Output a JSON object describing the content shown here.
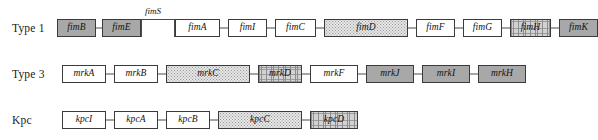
{
  "figure": {
    "type": "gene-cluster-diagram",
    "background": "#ffffff",
    "width": 528,
    "height": 140,
    "fill_legend": {
      "white": "#ffffff",
      "solid_gray": "#a8a8a8",
      "stipple_light": "#e6e6e6",
      "hatch": "#d2d2d2",
      "hatch_dark": "#9e9e9e"
    }
  },
  "rows": [
    {
      "id": "type-1",
      "label": "Type 1",
      "top": 8,
      "genes": [
        {
          "name": "fimB",
          "x": 57,
          "w": 39,
          "h": 18,
          "fill": "fill-gray"
        },
        {
          "name": "fimE",
          "x": 102,
          "w": 39,
          "h": 18,
          "fill": "fill-gray"
        },
        {
          "name": "fimA",
          "x": 175,
          "w": 45,
          "h": 18,
          "fill": "fill-white"
        },
        {
          "name": "fimI",
          "x": 228,
          "w": 39,
          "h": 18,
          "fill": "fill-white"
        },
        {
          "name": "fimC",
          "x": 275,
          "w": 41,
          "h": 18,
          "fill": "fill-white"
        },
        {
          "name": "fimD",
          "x": 324,
          "w": 84,
          "h": 18,
          "fill": "fill-stipple"
        },
        {
          "name": "fimF",
          "x": 416,
          "w": 39,
          "h": 18,
          "fill": "fill-white"
        },
        {
          "name": "fimG",
          "x": 463,
          "w": 39,
          "h": 18,
          "fill": "fill-white"
        },
        {
          "name": "fimH",
          "x": 510,
          "w": 41,
          "h": 18,
          "fill": "fill-hatch"
        },
        {
          "name": "fimK",
          "x": 559,
          "w": 39,
          "h": 18,
          "fill": "fill-gray"
        }
      ],
      "connectors": [
        {
          "x": 96,
          "w": 6
        },
        {
          "x": 220,
          "w": 8
        },
        {
          "x": 267,
          "w": 8
        },
        {
          "x": 316,
          "w": 8
        },
        {
          "x": 408,
          "w": 8
        },
        {
          "x": 455,
          "w": 8
        },
        {
          "x": 502,
          "w": 8
        },
        {
          "x": 551,
          "w": 8
        }
      ],
      "switch": {
        "label": "fimS",
        "x": 141,
        "w": 34,
        "label_x": 145,
        "label_y": -2
      }
    },
    {
      "id": "type-3",
      "label": "Type 3",
      "top": 54,
      "genes": [
        {
          "name": "mrkA",
          "x": 62,
          "w": 44,
          "h": 18,
          "fill": "fill-white"
        },
        {
          "name": "mrkB",
          "x": 114,
          "w": 44,
          "h": 18,
          "fill": "fill-white"
        },
        {
          "name": "mrkC",
          "x": 166,
          "w": 84,
          "h": 18,
          "fill": "fill-stipple"
        },
        {
          "name": "mrkD",
          "x": 258,
          "w": 44,
          "h": 18,
          "fill": "fill-hatch"
        },
        {
          "name": "mrkF",
          "x": 310,
          "w": 48,
          "h": 18,
          "fill": "fill-white"
        },
        {
          "name": "mrkJ",
          "x": 366,
          "w": 48,
          "h": 18,
          "fill": "fill-gray"
        },
        {
          "name": "mrkI",
          "x": 422,
          "w": 48,
          "h": 18,
          "fill": "fill-gray"
        },
        {
          "name": "mrkH",
          "x": 478,
          "w": 48,
          "h": 18,
          "fill": "fill-gray"
        }
      ],
      "connectors": [
        {
          "x": 106,
          "w": 8
        },
        {
          "x": 158,
          "w": 8
        },
        {
          "x": 250,
          "w": 8
        },
        {
          "x": 302,
          "w": 8
        },
        {
          "x": 358,
          "w": 8
        },
        {
          "x": 414,
          "w": 8
        },
        {
          "x": 470,
          "w": 8
        }
      ]
    },
    {
      "id": "kpc",
      "label": "Kpc",
      "top": 100,
      "genes": [
        {
          "name": "kpcI",
          "x": 62,
          "w": 44,
          "h": 18,
          "fill": "fill-white"
        },
        {
          "name": "kpcA",
          "x": 114,
          "w": 44,
          "h": 18,
          "fill": "fill-white"
        },
        {
          "name": "kpcB",
          "x": 166,
          "w": 44,
          "h": 18,
          "fill": "fill-white"
        },
        {
          "name": "kpcC",
          "x": 218,
          "w": 84,
          "h": 18,
          "fill": "fill-stipple"
        },
        {
          "name": "kpcD",
          "x": 310,
          "w": 48,
          "h": 18,
          "fill": "fill-hatch"
        }
      ],
      "connectors": [
        {
          "x": 106,
          "w": 8
        },
        {
          "x": 158,
          "w": 8
        },
        {
          "x": 210,
          "w": 8
        },
        {
          "x": 302,
          "w": 8
        }
      ]
    }
  ]
}
